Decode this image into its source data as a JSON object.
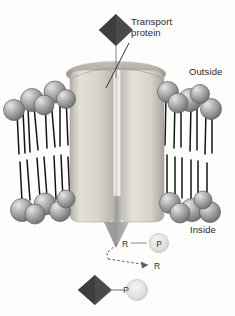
{
  "figure": {
    "background_color": "#fdfdfc"
  },
  "labels": {
    "transport_protein": "Transport\nprotein",
    "outside": "Outside",
    "inside": "Inside"
  },
  "symbols": {
    "r_phosphate_r": "R",
    "r_phosphate_p": "P",
    "r_free": "R",
    "solute_p": "P"
  },
  "colors": {
    "solute_diamond": "#4a4a4a",
    "lipid_head": "#9a9a9a",
    "lipid_head_dark": "#6f6f6f",
    "lipid_tail": "#1a1a1a",
    "protein_body": "#d2cfc8",
    "protein_shade": "#a8a49c",
    "channel": "#f2f0ec",
    "arrow": "#a6a6a6",
    "phosphate_circle": "#e2e2e2",
    "text": "#2b2b2b",
    "leader_line": "#333333"
  },
  "elements": {
    "solute_top": "dark-diamond-solute",
    "solute_bottom": "dark-diamond-solute",
    "channel_arrow": "downward-transport-arrow",
    "dashed_reaction_arrow": "dephosphorylation-arrow",
    "bilayer": "phospholipid-bilayer",
    "protein": "transport-protein-channel"
  },
  "counts": {
    "lipids_outer_left": 5,
    "lipids_outer_right": 5,
    "lipids_inner_left": 5,
    "lipids_inner_right": 5
  }
}
